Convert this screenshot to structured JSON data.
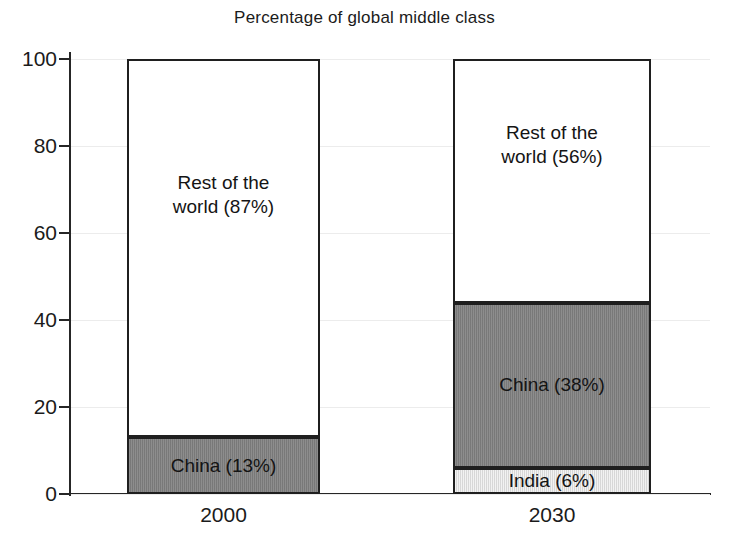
{
  "chart_data": {
    "type": "bar",
    "subtype": "stacked-bar",
    "title": "Percentage of global middle class",
    "xlabel": "",
    "ylabel": "",
    "ylim": [
      0,
      100
    ],
    "yticks": [
      0,
      20,
      40,
      60,
      80,
      100
    ],
    "ytick_labels": [
      "0",
      "20",
      "40",
      "60",
      "80",
      "100"
    ],
    "grid": true,
    "legend": "none",
    "categories": [
      "2000",
      "2030"
    ],
    "series": [
      {
        "name": "India",
        "values": [
          0,
          6
        ],
        "color": "#e3e3e3"
      },
      {
        "name": "China",
        "values": [
          13,
          38
        ],
        "color": "#808080"
      },
      {
        "name": "Rest of the world",
        "values": [
          87,
          56
        ],
        "color": "#ffffff"
      }
    ],
    "bars": [
      {
        "category": "2000",
        "segments": [
          {
            "name": "rest-of-world",
            "label": "Rest of the\nworld (87%)",
            "value": 87,
            "start": 13,
            "end": 100,
            "color": "#ffffff"
          },
          {
            "name": "china",
            "label": "China (13%)",
            "value": 13,
            "start": 0,
            "end": 13,
            "color": "#808080"
          }
        ]
      },
      {
        "category": "2030",
        "segments": [
          {
            "name": "rest-of-world",
            "label": "Rest of the\nworld (56%)",
            "value": 56,
            "start": 44,
            "end": 100,
            "color": "#ffffff"
          },
          {
            "name": "china",
            "label": "China (38%)",
            "value": 38,
            "start": 6,
            "end": 44,
            "color": "#808080"
          },
          {
            "name": "india",
            "label": "India (6%)",
            "value": 6,
            "start": 0,
            "end": 6,
            "color": "#e3e3e3"
          }
        ]
      }
    ],
    "annotations": [
      "Rest of the world (87%)",
      "China (13%)",
      "Rest of the world (56%)",
      "China (38%)",
      "India (6%)"
    ]
  },
  "axis": {
    "ticks": [
      {
        "label": "100",
        "value": 100
      },
      {
        "label": "80",
        "value": 80
      },
      {
        "label": "60",
        "value": 60
      },
      {
        "label": "40",
        "value": 40
      },
      {
        "label": "20",
        "value": 20
      },
      {
        "label": "0",
        "value": 0
      }
    ]
  },
  "colors": {
    "axis": "#262626",
    "grid": "#ececec",
    "text": "#1b1b1b",
    "china": "#808080",
    "india": "#e3e3e3",
    "rest_of_world": "#ffffff"
  }
}
